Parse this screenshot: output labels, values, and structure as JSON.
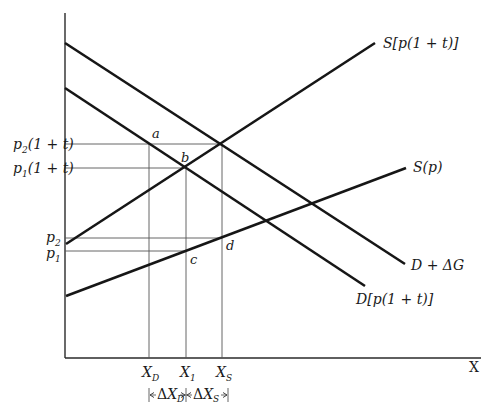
{
  "diagram": {
    "axes": {
      "x_label": "X",
      "y_label": ""
    },
    "curves": [
      {
        "id": "demand_plus_g",
        "label": "D + ΔG",
        "from": [
          65,
          43
        ],
        "to": [
          405,
          264
        ]
      },
      {
        "id": "demand_tax",
        "label": "D[p(1 + t)]",
        "from": [
          65,
          88
        ],
        "to": [
          365,
          286
        ]
      },
      {
        "id": "supply_tax",
        "label": "S[p(1 + t)]",
        "from": [
          66,
          244
        ],
        "to": [
          375,
          43
        ]
      },
      {
        "id": "supply",
        "label": "S(p)",
        "from": [
          66,
          296
        ],
        "to": [
          406,
          168
        ]
      }
    ],
    "price_labels": {
      "p2_1t": {
        "base": "p",
        "sub": "2",
        "rest": "(1 + t)"
      },
      "p1_1t": {
        "base": "p",
        "sub": "1",
        "rest": "(1 + t)"
      },
      "p2": {
        "base": "p",
        "sub": "2"
      },
      "p1": {
        "base": "p",
        "sub": "1"
      }
    },
    "quantity_labels": {
      "xd": {
        "base": "X",
        "sub": "D"
      },
      "x1": {
        "base": "X",
        "sub": "1"
      },
      "xs": {
        "base": "X",
        "sub": "S"
      }
    },
    "points": {
      "a": "a",
      "b": "b",
      "c": "c",
      "d": "d"
    },
    "bracket": {
      "left": {
        "delta": "Δ",
        "base": "X",
        "sub": "D"
      },
      "right": {
        "delta": "Δ",
        "base": "X",
        "sub": "S"
      }
    }
  }
}
